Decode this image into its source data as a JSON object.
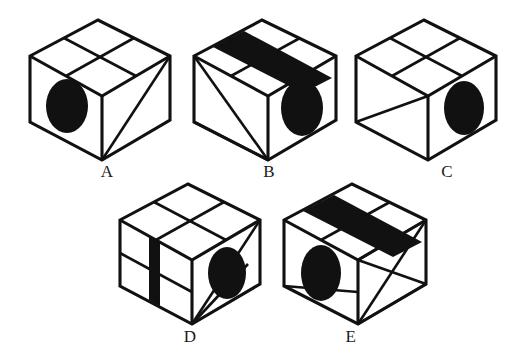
{
  "figure": {
    "kind": "spatial-reasoning-cube-set",
    "background_color": "#ffffff",
    "ink_color": "#111111",
    "option_count": 5
  },
  "options": [
    {
      "id": "A",
      "label": "A",
      "label_x": 94,
      "label_y": 162,
      "origin_x": 22,
      "origin_y": 12,
      "top_face": {
        "grid": "2x2",
        "band": "none"
      },
      "left_face": {
        "marking": "ellipse",
        "grid": "none"
      },
      "right_face": {
        "marking": "single-diagonal",
        "grid": "none"
      }
    },
    {
      "id": "B",
      "label": "B",
      "label_x": 256,
      "label_y": 162,
      "origin_x": 186,
      "origin_y": 12,
      "top_face": {
        "grid": "2x2",
        "band": "black-diagonal-stripe"
      },
      "left_face": {
        "marking": "two-diagonals",
        "grid": "none"
      },
      "right_face": {
        "marking": "ellipse",
        "grid": "none"
      }
    },
    {
      "id": "C",
      "label": "C",
      "label_x": 434,
      "label_y": 162,
      "origin_x": 348,
      "origin_y": 12,
      "top_face": {
        "grid": "2x2",
        "band": "none"
      },
      "left_face": {
        "marking": "single-diagonal",
        "grid": "none"
      },
      "right_face": {
        "marking": "ellipse",
        "grid": "none"
      }
    },
    {
      "id": "D",
      "label": "D",
      "label_x": 177,
      "label_y": 327,
      "origin_x": 112,
      "origin_y": 176,
      "top_face": {
        "grid": "2x2",
        "band": "none"
      },
      "left_face": {
        "marking": "black-vertical-bar",
        "grid": "2x2"
      },
      "right_face": {
        "marking": "ellipse-with-two-diagonals",
        "grid": "none"
      }
    },
    {
      "id": "E",
      "label": "E",
      "label_x": 338,
      "label_y": 327,
      "origin_x": 276,
      "origin_y": 176,
      "top_face": {
        "grid": "2x2",
        "band": "black-diagonal-stripe"
      },
      "left_face": {
        "marking": "ellipse-with-horizontal-divider",
        "grid": "none"
      },
      "right_face": {
        "marking": "bowtie-x",
        "grid": "none"
      }
    }
  ]
}
